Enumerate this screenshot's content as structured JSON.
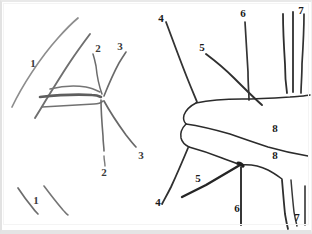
{
  "figure": {
    "medium": "pencil and ink on paper",
    "background_color": "#ffffff",
    "ink_color": "#2b2b2b",
    "pencil_color": "#6e6e6e",
    "label_color": "#1a1a1a",
    "border_color": "#e4e4e4",
    "width": 312,
    "height": 234
  },
  "panels": [
    {
      "id": "left-panel",
      "name": "left-sketch",
      "medium": "pencil",
      "description": "lighter grey pencil strokes, three long horizontal lines meeting a node at right with radiating strokes"
    },
    {
      "id": "right-panel",
      "name": "right-sketch",
      "medium": "ink",
      "description": "darker ink strokes, outlined contour with vertical and oblique radiating lines"
    }
  ],
  "labels": [
    {
      "id": "l1",
      "text": "1",
      "x": 33,
      "y": 63,
      "panel": "left-panel",
      "style": "pencil"
    },
    {
      "id": "l2",
      "text": "2",
      "x": 98,
      "y": 48,
      "panel": "left-panel",
      "style": "pencil"
    },
    {
      "id": "l3",
      "text": "3",
      "x": 120,
      "y": 46,
      "panel": "left-panel",
      "style": "pencil"
    },
    {
      "id": "l4",
      "text": "2",
      "x": 104,
      "y": 172,
      "panel": "left-panel",
      "style": "pencil"
    },
    {
      "id": "l5",
      "text": "3",
      "x": 141,
      "y": 155,
      "panel": "left-panel",
      "style": "pencil"
    },
    {
      "id": "l6",
      "text": "1",
      "x": 36,
      "y": 200,
      "panel": "left-panel",
      "style": "pencil"
    },
    {
      "id": "l7",
      "text": "4",
      "x": 161,
      "y": 18,
      "panel": "right-panel",
      "style": "ink"
    },
    {
      "id": "l8",
      "text": "5",
      "x": 202,
      "y": 47,
      "panel": "right-panel",
      "style": "ink"
    },
    {
      "id": "l9",
      "text": "6",
      "x": 243,
      "y": 13,
      "panel": "right-panel",
      "style": "ink"
    },
    {
      "id": "l10",
      "text": "7",
      "x": 301,
      "y": 10,
      "panel": "right-panel",
      "style": "ink"
    },
    {
      "id": "l11",
      "text": "8",
      "x": 275,
      "y": 128,
      "panel": "right-panel",
      "style": "ink"
    },
    {
      "id": "l12",
      "text": "8",
      "x": 275,
      "y": 155,
      "panel": "right-panel",
      "style": "ink"
    },
    {
      "id": "l13",
      "text": "5",
      "x": 198,
      "y": 178,
      "panel": "right-panel",
      "style": "ink"
    },
    {
      "id": "l14",
      "text": "4",
      "x": 158,
      "y": 202,
      "panel": "right-panel",
      "style": "ink"
    },
    {
      "id": "l15",
      "text": "6",
      "x": 237,
      "y": 208,
      "panel": "right-panel",
      "style": "ink"
    },
    {
      "id": "l16",
      "text": "7",
      "x": 297,
      "y": 217,
      "panel": "right-panel",
      "style": "ink"
    }
  ],
  "strokes": {
    "left_panel": [
      {
        "name": "upper-outer-curve-1",
        "d": "M 12 107 C 22 86 40 58 58 38 C 66 29 72 23 78 18",
        "w": 1.7,
        "c": "#8d8d8d"
      },
      {
        "name": "upper-inner-curve-1",
        "d": "M 35 118 C 46 100 58 80 70 62 C 78 50 84 42 90 34",
        "w": 1.9,
        "c": "#6f6f6f"
      },
      {
        "name": "horizontal-top-line",
        "d": "M 50 89 C 62 86 74 85 86 87 C 92 88 96 90 100 92",
        "w": 1.5,
        "c": "#757575"
      },
      {
        "name": "horizontal-middle-line",
        "d": "M 40 97 C 58 95 76 94 92 95 C 97 95 99 96 101 97",
        "w": 2.6,
        "c": "#5e5e5e"
      },
      {
        "name": "horizontal-bottom-line",
        "d": "M 42 107 C 60 106 78 105 94 104 C 99 104 101 103 103 101",
        "w": 1.6,
        "c": "#717171"
      },
      {
        "name": "radiating-stroke-2-upper",
        "d": "M 102 94 C 99 86 97 76 96 66 C 95 61 94 57 93 54",
        "w": 1.5,
        "c": "#6c6c6c"
      },
      {
        "name": "radiating-stroke-3-upper",
        "d": "M 104 96 C 108 86 113 74 119 63 C 122 58 124 55 126 52",
        "w": 1.6,
        "c": "#6a6a6a"
      },
      {
        "name": "radiating-stroke-2-lower",
        "d": "M 101 100 C 101 112 102 124 103 136 C 103 142 104 147 104 151",
        "w": 1.6,
        "c": "#6b6b6b"
      },
      {
        "name": "radiating-stroke-2-lower-tail",
        "d": "M 104 156 C 104 160 105 163 105 166",
        "w": 1.4,
        "c": "#7a7a7a"
      },
      {
        "name": "radiating-stroke-3-lower",
        "d": "M 104 101 C 110 112 118 124 126 135 C 130 140 133 144 136 147",
        "w": 1.7,
        "c": "#686868"
      },
      {
        "name": "bottom-short-stroke-left",
        "d": "M 18 188 C 22 194 27 201 32 207 C 34 210 36 212 38 214",
        "w": 1.7,
        "c": "#6d6d6d"
      },
      {
        "name": "bottom-short-stroke-right",
        "d": "M 44 186 C 50 194 57 203 63 210 C 65 212 66 214 68 215",
        "w": 1.6,
        "c": "#757575"
      }
    ],
    "right_panel": [
      {
        "name": "line-4-upper",
        "d": "M 166 22 C 172 38 180 60 188 80 C 192 90 195 97 197 102",
        "w": 1.8,
        "c": "#333333"
      },
      {
        "name": "line-5-upper",
        "d": "M 206 54 C 214 60 224 68 234 78 C 244 88 254 98 262 105",
        "w": 1.9,
        "c": "#2f2f2f"
      },
      {
        "name": "line-6-upper",
        "d": "M 245 22 C 246 38 247 56 248 72 C 248 84 249 93 249 100",
        "w": 1.7,
        "c": "#343434"
      },
      {
        "name": "line-7a-upper",
        "d": "M 283 14 C 283 30 284 48 285 64 C 285 76 286 86 287 93",
        "w": 1.8,
        "c": "#2e2e2e"
      },
      {
        "name": "line-7b-upper",
        "d": "M 293 12 C 293 28 293 46 293 62 C 293 74 293 84 293 92",
        "w": 1.8,
        "c": "#2e2e2e"
      },
      {
        "name": "line-7c-upper",
        "d": "M 304 14 C 304 30 303 48 302 64 C 302 76 301 86 301 93",
        "w": 1.7,
        "c": "#323232"
      },
      {
        "name": "contour-upper-ridge",
        "d": "M 196 103 C 210 100 226 99 242 99 C 258 99 274 98 290 97 C 300 96 306 96 310 95",
        "w": 1.5,
        "c": "#2b2b2b"
      },
      {
        "name": "contour-left-notch",
        "d": "M 196 103 C 190 106 186 110 184 115 C 183 119 184 122 186 124",
        "w": 1.5,
        "c": "#2b2b2b"
      },
      {
        "name": "contour-lower-ridge",
        "d": "M 186 124 C 200 126 216 130 230 134 C 244 139 256 143 268 147 C 282 151 296 154 308 156",
        "w": 1.5,
        "c": "#2b2b2b"
      },
      {
        "name": "contour-lower-left",
        "d": "M 186 124 C 182 128 180 133 181 138 C 182 142 185 145 189 147",
        "w": 1.5,
        "c": "#2d2d2d"
      },
      {
        "name": "contour-lower-arc",
        "d": "M 189 147 C 200 150 212 154 222 158 C 230 161 236 163 240 165",
        "w": 1.6,
        "c": "#2b2b2b"
      },
      {
        "name": "contour-right-lower-step",
        "d": "M 240 165 C 250 164 260 166 268 170 C 274 173 278 176 282 179",
        "w": 1.5,
        "c": "#2c2c2c"
      },
      {
        "name": "line-4-lower",
        "d": "M 188 148 C 183 160 177 174 171 187 C 167 195 164 200 162 204",
        "w": 1.8,
        "c": "#303030"
      },
      {
        "name": "line-5-lower",
        "d": "M 240 165 C 230 171 218 178 206 185 C 196 190 188 194 182 197",
        "w": 2.4,
        "c": "#252525"
      },
      {
        "name": "line-6-lower",
        "d": "M 241 167 C 241 180 241 194 241 206 C 241 214 241 220 241 225",
        "w": 1.9,
        "c": "#2d2d2d"
      },
      {
        "name": "line-7a-lower",
        "d": "M 282 180 C 283 192 284 204 285 214 C 286 220 287 225 288 229",
        "w": 1.8,
        "c": "#2f2f2f"
      },
      {
        "name": "line-7b-lower",
        "d": "M 291 180 C 292 192 293 203 294 212 C 295 218 296 222 297 226",
        "w": 1.5,
        "c": "#383838"
      },
      {
        "name": "line-7c-lower",
        "d": "M 305 186 C 305 196 305 206 305 214 C 305 219 305 222 305 225",
        "w": 1.6,
        "c": "#343434"
      },
      {
        "name": "node-dot-center",
        "d": "M 238 163 C 240 163 242 164 243 166",
        "w": 3.2,
        "c": "#202020"
      }
    ]
  }
}
